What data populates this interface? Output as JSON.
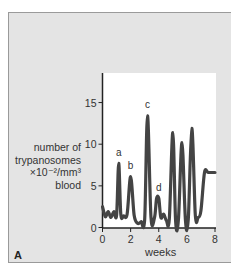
{
  "figure": {
    "panel_letter": "A",
    "ylabel_lines": [
      "number of",
      "trypanosomes",
      "×10⁻²/mm³",
      "blood"
    ],
    "xlabel": "weeks"
  },
  "chart_data": {
    "type": "line",
    "title": "",
    "xlabel": "weeks",
    "ylabel": "number of trypanosomes ×10⁻²/mm³ blood",
    "xlim": [
      0,
      8
    ],
    "ylim": [
      0,
      17
    ],
    "xticks": [
      0,
      2,
      4,
      6,
      8
    ],
    "yticks": [
      0,
      5,
      10,
      15
    ],
    "grid": false,
    "legend": null,
    "series": [
      {
        "name": "parasitaemia",
        "x": [
          0,
          0.2,
          0.4,
          0.6,
          0.8,
          1.0,
          1.15,
          1.3,
          1.5,
          1.75,
          2.0,
          2.25,
          2.5,
          2.75,
          3.0,
          3.2,
          3.45,
          3.7,
          3.85,
          4.0,
          4.15,
          4.35,
          4.55,
          4.75,
          5.0,
          5.2,
          5.4,
          5.65,
          5.9,
          6.1,
          6.35,
          6.6,
          6.8,
          7.0,
          7.25,
          7.5,
          7.75,
          8.0
        ],
        "values": [
          2.5,
          1.3,
          1.9,
          1.2,
          1.9,
          1.5,
          7.7,
          1.6,
          1.4,
          1.6,
          6.1,
          1.5,
          0.5,
          0.7,
          1.0,
          13.4,
          1.2,
          1.2,
          3.5,
          3.5,
          1.2,
          1.6,
          0.8,
          1.0,
          11.4,
          0.8,
          0.9,
          10.2,
          0.8,
          1.0,
          11.9,
          1.5,
          1.2,
          2.0,
          6.6,
          6.6,
          6.6,
          6.6
        ]
      }
    ],
    "annotations": [
      {
        "text": "a",
        "x": 1.15,
        "y": 8.6
      },
      {
        "text": "b",
        "x": 2.0,
        "y": 7.0
      },
      {
        "text": "c",
        "x": 3.2,
        "y": 14.3
      },
      {
        "text": "d",
        "x": 4.0,
        "y": 4.4
      }
    ]
  }
}
